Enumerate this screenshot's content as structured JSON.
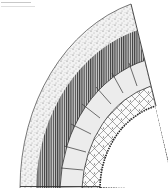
{
  "figure": {
    "type": "cross-section-diagram",
    "layers": [
      {
        "name": "outer-stippled-layer",
        "pattern": "stipple",
        "color": "#e8e8e8"
      },
      {
        "name": "hatched-layer",
        "pattern": "vertical-hatch",
        "color": "#777777"
      },
      {
        "name": "block-segment-layer",
        "pattern": "segmented-blocks",
        "color": "#ececec"
      },
      {
        "name": "netted-layer",
        "pattern": "cross-net",
        "color": "#ffffff"
      },
      {
        "name": "inner-rough-edge",
        "pattern": "rough-edge",
        "color": "#333333"
      }
    ],
    "colors": {
      "ink": "#2a2a2a",
      "background": "#ffffff"
    }
  }
}
